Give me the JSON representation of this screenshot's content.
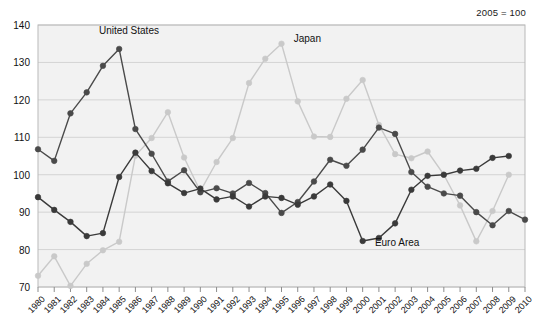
{
  "chart_data": {
    "type": "line",
    "title": "",
    "subtitle": "2005 = 100",
    "xlabel": "",
    "ylabel": "",
    "xlim": [
      1980,
      2010
    ],
    "ylim": [
      70,
      140
    ],
    "yticks": [
      70,
      80,
      90,
      100,
      110,
      120,
      130,
      140
    ],
    "grid": true,
    "legend_position": "inline-annotations",
    "x": [
      1980,
      1981,
      1982,
      1983,
      1984,
      1985,
      1986,
      1987,
      1988,
      1989,
      1990,
      1991,
      1992,
      1993,
      1994,
      1995,
      1996,
      1997,
      1998,
      1999,
      2000,
      2001,
      2002,
      2003,
      2004,
      2005,
      2006,
      2007,
      2008,
      2009,
      2010
    ],
    "categories": [
      "1980",
      "1981",
      "1982",
      "1983",
      "1984",
      "1985",
      "1986",
      "1987",
      "1988",
      "1989",
      "1990",
      "1991",
      "1992",
      "1993",
      "1994",
      "1995",
      "1996",
      "1997",
      "1998",
      "1999",
      "2000",
      "2001",
      "2002",
      "2003",
      "2004",
      "2005",
      "2006",
      "2007",
      "2008",
      "2009",
      "2010"
    ],
    "series": [
      {
        "name": "United States",
        "color": "#4a4a4a",
        "values": [
          106.8,
          103.7,
          116.4,
          122.0,
          129.1,
          133.6,
          112.2,
          105.6,
          98.2,
          101.2,
          95.3,
          96.4,
          95.0,
          97.8,
          95.1,
          89.8,
          92.7,
          98.2,
          104.0,
          102.4,
          106.7,
          112.6,
          110.9,
          100.7,
          96.8,
          95.0,
          94.4,
          90.0,
          86.5,
          90.3,
          88.0
        ]
      },
      {
        "name": "Japan",
        "color": "#c9c9c9",
        "values": [
          73.0,
          78.2,
          70.3,
          76.2,
          79.8,
          82.1,
          105.1,
          109.8,
          116.7,
          104.6,
          95.6,
          103.4,
          109.8,
          124.5,
          131.0,
          135.0,
          119.6,
          110.2,
          110.1,
          120.3,
          125.3,
          113.3,
          105.5,
          104.4,
          106.2,
          100.0,
          91.8,
          82.2,
          90.3,
          100.0,
          null
        ]
      },
      {
        "name": "Euro Area",
        "color": "#3a3a3a",
        "values": [
          94.0,
          90.6,
          87.4,
          83.6,
          84.4,
          99.4,
          105.9,
          101.0,
          97.7,
          95.1,
          96.3,
          93.4,
          94.2,
          91.5,
          94.2,
          93.8,
          92.0,
          94.2,
          97.4,
          93.0,
          82.3,
          83.1,
          87.0,
          96.0,
          99.7,
          100.0,
          101.1,
          101.6,
          104.5,
          105.0,
          null
        ]
      }
    ],
    "annotations": [
      {
        "text": "United States",
        "x": 1984,
        "y": 138,
        "color": "#111"
      },
      {
        "text": "Japan",
        "x": 1996,
        "y": 136,
        "color": "#111"
      },
      {
        "text": "Euro Area",
        "x": 2001,
        "y": 81.5,
        "color": "#111"
      }
    ]
  },
  "axis": {
    "ytick_labels": [
      "140",
      "130",
      "120",
      "110",
      "100",
      "90",
      "80",
      "70"
    ],
    "xtick_labels": [
      "1980",
      "1981",
      "1982",
      "1983",
      "1984",
      "1985",
      "1986",
      "1987",
      "1988",
      "1989",
      "1990",
      "1991",
      "1992",
      "1993",
      "1994",
      "1995",
      "1996",
      "1997",
      "1998",
      "1999",
      "2000",
      "2001",
      "2002",
      "2003",
      "2004",
      "2005",
      "2006",
      "2007",
      "2008",
      "2009",
      "2010"
    ]
  },
  "colors": {
    "plot_background": "#f2f2f2",
    "grid": "#d4d4d4",
    "frame": "#b9b9b9",
    "us": "#4a4a4a",
    "japan": "#c9c9c9",
    "euro": "#3a3a3a",
    "text": "#111111"
  },
  "subtitle_note": "2005 = 100"
}
